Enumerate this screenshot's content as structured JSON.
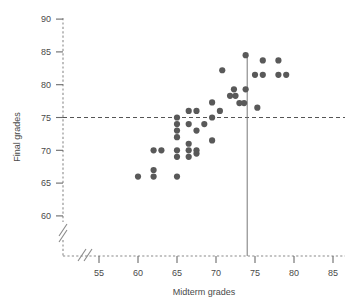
{
  "chart_data": {
    "type": "scatter",
    "title": "",
    "xlabel": "Midterm grades",
    "ylabel": "Final grades",
    "xlim": [
      52,
      86.5
    ],
    "ylim": [
      57.5,
      91
    ],
    "xticks": [
      55,
      60,
      65,
      70,
      75,
      80,
      85
    ],
    "yticks": [
      60,
      65,
      70,
      75,
      80,
      85,
      90
    ],
    "grid": false,
    "legend": null,
    "axis_break_x": true,
    "axis_break_y": true,
    "axis_style": "dashed",
    "marker_color": "#595959",
    "marker_size": 3.1,
    "reference_lines": [
      {
        "orientation": "horizontal",
        "value": 75,
        "style": "dashed",
        "color": "#555555",
        "label": "final grade 75"
      },
      {
        "orientation": "vertical",
        "value": 74,
        "style": "solid",
        "color": "#777777",
        "label": "midterm grade 74"
      }
    ],
    "points": [
      {
        "x": 60.0,
        "y": 66.0
      },
      {
        "x": 62.0,
        "y": 66.0
      },
      {
        "x": 62.0,
        "y": 67.0
      },
      {
        "x": 62.0,
        "y": 70.0
      },
      {
        "x": 63.0,
        "y": 70.0
      },
      {
        "x": 65.0,
        "y": 66.0
      },
      {
        "x": 65.0,
        "y": 69.0
      },
      {
        "x": 65.0,
        "y": 70.0
      },
      {
        "x": 65.0,
        "y": 72.0
      },
      {
        "x": 65.0,
        "y": 73.0
      },
      {
        "x": 65.0,
        "y": 74.0
      },
      {
        "x": 65.0,
        "y": 75.0
      },
      {
        "x": 66.5,
        "y": 69.0
      },
      {
        "x": 66.5,
        "y": 70.0
      },
      {
        "x": 66.5,
        "y": 71.0
      },
      {
        "x": 66.5,
        "y": 74.0
      },
      {
        "x": 66.5,
        "y": 76.0
      },
      {
        "x": 67.5,
        "y": 69.5
      },
      {
        "x": 67.5,
        "y": 70.0
      },
      {
        "x": 67.5,
        "y": 73.0
      },
      {
        "x": 67.5,
        "y": 76.0
      },
      {
        "x": 68.5,
        "y": 74.0
      },
      {
        "x": 69.5,
        "y": 71.5
      },
      {
        "x": 69.5,
        "y": 75.0
      },
      {
        "x": 69.5,
        "y": 77.3
      },
      {
        "x": 70.5,
        "y": 76.0
      },
      {
        "x": 70.8,
        "y": 82.2
      },
      {
        "x": 71.8,
        "y": 78.3
      },
      {
        "x": 72.3,
        "y": 79.3
      },
      {
        "x": 72.5,
        "y": 78.3
      },
      {
        "x": 73.0,
        "y": 77.2
      },
      {
        "x": 73.6,
        "y": 77.2
      },
      {
        "x": 73.8,
        "y": 79.3
      },
      {
        "x": 73.8,
        "y": 84.5
      },
      {
        "x": 75.0,
        "y": 81.5
      },
      {
        "x": 75.3,
        "y": 76.5
      },
      {
        "x": 76.0,
        "y": 81.5
      },
      {
        "x": 76.0,
        "y": 83.7
      },
      {
        "x": 78.0,
        "y": 81.5
      },
      {
        "x": 78.0,
        "y": 83.7
      },
      {
        "x": 79.0,
        "y": 81.5
      }
    ]
  },
  "axes": {
    "x_title": "Midterm grades",
    "y_title": "Final grades"
  }
}
